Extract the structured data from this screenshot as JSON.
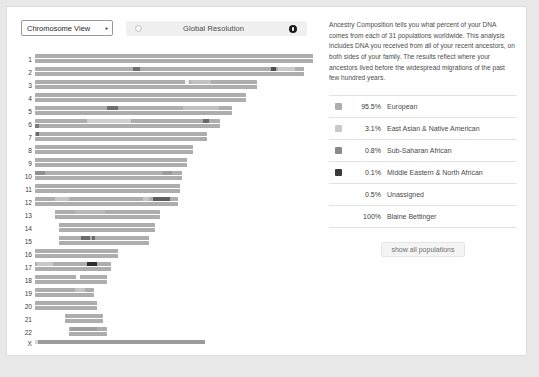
{
  "toolbar": {
    "view_select_value": "Chromosome View",
    "view_select_caret": "▼",
    "resolution_label": "Global Resolution",
    "knob_low_name": "resolution-min-knob",
    "knob_high_name": "resolution-max-knob"
  },
  "panel": {
    "blurb": "Ancestry Composition tells you what percent of your DNA comes from each of 31 populations worldwide. This analysis includes DNA you received from all of your recent ancestors, on both sides of your family. The results reflect where your ancestors lived before the widespread migrations of the past few hundred years.",
    "legend": [
      {
        "percent": "95.5%",
        "population": "European",
        "color": "#adadad",
        "has_swatch": true
      },
      {
        "percent": "3.1%",
        "population": "East Asian & Native American",
        "color": "#c9c9c9",
        "has_swatch": true
      },
      {
        "percent": "0.8%",
        "population": "Sub-Saharan African",
        "color": "#8a8a8a",
        "has_swatch": true
      },
      {
        "percent": "0.1%",
        "population": "Middle Eastern & North African",
        "color": "#3a3a3a",
        "has_swatch": true
      },
      {
        "percent": "0.5%",
        "population": "Unassigned",
        "color": "",
        "has_swatch": false
      },
      {
        "percent": "100%",
        "population": "Blaine Bettinger",
        "color": "",
        "has_swatch": false
      }
    ],
    "show_all_label": "show all populations"
  },
  "chart_data": {
    "type": "chromosome-painting",
    "title": "Chromosome View",
    "xlabel": "",
    "ylabel": "Chromosome",
    "grid": false,
    "colors": {
      "european": "#adadad",
      "east_asian_native_american": "#c9c9c9",
      "sub_saharan_african": "#8a8a8a",
      "middle_eastern_north_african": "#3a3a3a",
      "unassigned": "#ffffff"
    },
    "axis_note": "bar length proportional to chromosome length; two haplotype bars per autosome, one for X",
    "chromosomes": [
      {
        "label": "1",
        "start": 18,
        "length": 278,
        "haplotypes": [
          {
            "segments": [
              {
                "off": 0,
                "len": 278,
                "color": "#adadad"
              }
            ]
          },
          {
            "segments": [
              {
                "off": 0,
                "len": 278,
                "color": "#adadad"
              }
            ]
          }
        ]
      },
      {
        "label": "2",
        "start": 18,
        "length": 269,
        "haplotypes": [
          {
            "segments": [
              {
                "off": 0,
                "len": 269,
                "color": "#adadad"
              },
              {
                "off": 98,
                "len": 7,
                "color": "#6f6f6f"
              },
              {
                "off": 236,
                "len": 5,
                "color": "#4f4f4f"
              },
              {
                "off": 243,
                "len": 17,
                "color": "#c9c9c9"
              }
            ]
          },
          {
            "segments": [
              {
                "off": 0,
                "len": 269,
                "color": "#adadad"
              }
            ]
          }
        ]
      },
      {
        "label": "3",
        "start": 18,
        "length": 222,
        "haplotypes": [
          {
            "segments": [
              {
                "off": 0,
                "len": 222,
                "color": "#adadad"
              },
              {
                "off": 150,
                "len": 4,
                "color": "#efefef"
              },
              {
                "off": 156,
                "len": 20,
                "color": "#c2c2c2"
              }
            ]
          },
          {
            "segments": [
              {
                "off": 0,
                "len": 222,
                "color": "#adadad"
              }
            ]
          }
        ]
      },
      {
        "label": "4",
        "start": 18,
        "length": 211,
        "haplotypes": [
          {
            "segments": [
              {
                "off": 0,
                "len": 211,
                "color": "#adadad"
              }
            ]
          },
          {
            "segments": [
              {
                "off": 0,
                "len": 211,
                "color": "#adadad"
              }
            ]
          }
        ]
      },
      {
        "label": "5",
        "start": 18,
        "length": 197,
        "haplotypes": [
          {
            "segments": [
              {
                "off": 0,
                "len": 197,
                "color": "#adadad"
              },
              {
                "off": 72,
                "len": 11,
                "color": "#6f6f6f"
              },
              {
                "off": 148,
                "len": 36,
                "color": "#c0c0c0"
              }
            ]
          },
          {
            "segments": [
              {
                "off": 0,
                "len": 197,
                "color": "#adadad"
              }
            ]
          }
        ]
      },
      {
        "label": "6",
        "start": 18,
        "length": 185,
        "haplotypes": [
          {
            "segments": [
              {
                "off": 0,
                "len": 185,
                "color": "#adadad"
              },
              {
                "off": 52,
                "len": 44,
                "color": "#cfcfcf"
              },
              {
                "off": 168,
                "len": 6,
                "color": "#6a6a6a"
              }
            ]
          },
          {
            "segments": [
              {
                "off": 0,
                "len": 185,
                "color": "#adadad"
              },
              {
                "off": 0,
                "len": 4,
                "color": "#7a7a7a"
              }
            ]
          }
        ]
      },
      {
        "label": "7",
        "start": 18,
        "length": 172,
        "haplotypes": [
          {
            "segments": [
              {
                "off": 0,
                "len": 172,
                "color": "#adadad"
              },
              {
                "off": 1,
                "len": 3,
                "color": "#6a6a6a"
              }
            ]
          },
          {
            "segments": [
              {
                "off": 0,
                "len": 172,
                "color": "#adadad"
              }
            ]
          }
        ]
      },
      {
        "label": "8",
        "start": 18,
        "length": 158,
        "haplotypes": [
          {
            "segments": [
              {
                "off": 0,
                "len": 158,
                "color": "#adadad"
              }
            ]
          },
          {
            "segments": [
              {
                "off": 0,
                "len": 158,
                "color": "#adadad"
              }
            ]
          }
        ]
      },
      {
        "label": "9",
        "start": 18,
        "length": 152,
        "haplotypes": [
          {
            "segments": [
              {
                "off": 0,
                "len": 152,
                "color": "#adadad"
              }
            ]
          },
          {
            "segments": [
              {
                "off": 0,
                "len": 152,
                "color": "#adadad"
              }
            ]
          }
        ]
      },
      {
        "label": "10",
        "start": 18,
        "length": 147,
        "haplotypes": [
          {
            "segments": [
              {
                "off": 0,
                "len": 147,
                "color": "#adadad"
              },
              {
                "off": 0,
                "len": 10,
                "color": "#8f8f8f"
              },
              {
                "off": 128,
                "len": 9,
                "color": "#9a9a9a"
              }
            ]
          },
          {
            "segments": [
              {
                "off": 0,
                "len": 147,
                "color": "#adadad"
              }
            ]
          }
        ]
      },
      {
        "label": "11",
        "start": 18,
        "length": 145,
        "haplotypes": [
          {
            "segments": [
              {
                "off": 0,
                "len": 145,
                "color": "#adadad"
              }
            ]
          },
          {
            "segments": [
              {
                "off": 0,
                "len": 145,
                "color": "#adadad"
              }
            ]
          }
        ]
      },
      {
        "label": "12",
        "start": 18,
        "length": 143,
        "haplotypes": [
          {
            "segments": [
              {
                "off": 0,
                "len": 143,
                "color": "#adadad"
              },
              {
                "off": 20,
                "len": 14,
                "color": "#c6c6c6"
              },
              {
                "off": 108,
                "len": 6,
                "color": "#c6c6c6"
              },
              {
                "off": 118,
                "len": 17,
                "color": "#5d5d5d"
              }
            ]
          },
          {
            "segments": [
              {
                "off": 0,
                "len": 143,
                "color": "#adadad"
              }
            ]
          }
        ]
      },
      {
        "label": "13",
        "start": 38,
        "length": 105,
        "haplotypes": [
          {
            "segments": [
              {
                "off": 0,
                "len": 105,
                "color": "#adadad"
              },
              {
                "off": 20,
                "len": 30,
                "color": "#b8b8b8"
              }
            ]
          },
          {
            "segments": [
              {
                "off": 0,
                "len": 105,
                "color": "#adadad"
              }
            ]
          }
        ]
      },
      {
        "label": "14",
        "start": 42,
        "length": 96,
        "haplotypes": [
          {
            "segments": [
              {
                "off": 0,
                "len": 96,
                "color": "#adadad"
              }
            ]
          },
          {
            "segments": [
              {
                "off": 0,
                "len": 96,
                "color": "#adadad"
              }
            ]
          }
        ]
      },
      {
        "label": "15",
        "start": 42,
        "length": 90,
        "haplotypes": [
          {
            "segments": [
              {
                "off": 0,
                "len": 90,
                "color": "#adadad"
              },
              {
                "off": 22,
                "len": 9,
                "color": "#6b6b6b"
              },
              {
                "off": 33,
                "len": 3,
                "color": "#6b6b6b"
              }
            ]
          },
          {
            "segments": [
              {
                "off": 0,
                "len": 90,
                "color": "#adadad"
              }
            ]
          }
        ]
      },
      {
        "label": "16",
        "start": 18,
        "length": 83,
        "haplotypes": [
          {
            "segments": [
              {
                "off": 0,
                "len": 83,
                "color": "#adadad"
              }
            ]
          },
          {
            "segments": [
              {
                "off": 0,
                "len": 83,
                "color": "#adadad"
              }
            ]
          }
        ]
      },
      {
        "label": "17",
        "start": 18,
        "length": 76,
        "haplotypes": [
          {
            "segments": [
              {
                "off": 0,
                "len": 76,
                "color": "#adadad"
              },
              {
                "off": 2,
                "len": 16,
                "color": "#c8c8c8"
              },
              {
                "off": 52,
                "len": 10,
                "color": "#2e2e2e"
              }
            ]
          },
          {
            "segments": [
              {
                "off": 0,
                "len": 76,
                "color": "#adadad"
              }
            ]
          }
        ]
      },
      {
        "label": "18",
        "start": 18,
        "length": 72,
        "haplotypes": [
          {
            "segments": [
              {
                "off": 0,
                "len": 72,
                "color": "#adadad"
              },
              {
                "off": 41,
                "len": 4,
                "color": "#ffffff"
              }
            ]
          },
          {
            "segments": [
              {
                "off": 0,
                "len": 72,
                "color": "#adadad"
              }
            ]
          }
        ]
      },
      {
        "label": "19",
        "start": 18,
        "length": 59,
        "haplotypes": [
          {
            "segments": [
              {
                "off": 0,
                "len": 59,
                "color": "#adadad"
              },
              {
                "off": 40,
                "len": 10,
                "color": "#c4c4c4"
              }
            ]
          },
          {
            "segments": [
              {
                "off": 0,
                "len": 59,
                "color": "#adadad"
              }
            ]
          }
        ]
      },
      {
        "label": "20",
        "start": 18,
        "length": 62,
        "haplotypes": [
          {
            "segments": [
              {
                "off": 0,
                "len": 62,
                "color": "#adadad"
              }
            ]
          },
          {
            "segments": [
              {
                "off": 0,
                "len": 62,
                "color": "#adadad"
              }
            ]
          }
        ]
      },
      {
        "label": "21",
        "start": 48,
        "length": 38,
        "haplotypes": [
          {
            "segments": [
              {
                "off": 0,
                "len": 38,
                "color": "#adadad"
              }
            ]
          },
          {
            "segments": [
              {
                "off": 0,
                "len": 38,
                "color": "#adadad"
              }
            ]
          }
        ]
      },
      {
        "label": "22",
        "start": 52,
        "length": 38,
        "haplotypes": [
          {
            "segments": [
              {
                "off": 0,
                "len": 38,
                "color": "#adadad"
              },
              {
                "off": 2,
                "len": 26,
                "color": "#9f9f9f"
              }
            ]
          },
          {
            "segments": [
              {
                "off": 0,
                "len": 38,
                "color": "#adadad"
              }
            ]
          }
        ]
      },
      {
        "label": "X",
        "start": 18,
        "length": 170,
        "haplotypes": [
          {
            "segments": [
              {
                "off": 0,
                "len": 170,
                "color": "#9b9b9b"
              },
              {
                "off": 0,
                "len": 3,
                "color": "#d8d8d8"
              }
            ]
          }
        ]
      }
    ]
  }
}
